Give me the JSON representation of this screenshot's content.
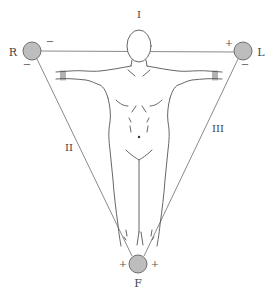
{
  "colors": {
    "line": "#8a8a8a",
    "figure_line": "#555555",
    "electrode_fill": "#bdbdbd",
    "electrode_stroke": "#6e6e6e",
    "text": "#444444"
  },
  "electrodes": [
    {
      "id": "R",
      "label": "R",
      "meaning": "right arm",
      "cx": 32,
      "cy": 51
    },
    {
      "id": "L",
      "label": "L",
      "meaning": "left arm",
      "cx": 243,
      "cy": 51
    },
    {
      "id": "F",
      "label": "F",
      "meaning": "foot (left leg)",
      "cx": 138,
      "cy": 264
    }
  ],
  "leads": [
    {
      "id": "I",
      "label": "I",
      "from": "R",
      "to": "L"
    },
    {
      "id": "II",
      "label": "II",
      "from": "R",
      "to": "F"
    },
    {
      "id": "III",
      "label": "III",
      "from": "L",
      "to": "F"
    }
  ],
  "polarity_signs": {
    "R_lead_I": "−",
    "R_lead_II": "−",
    "L_lead_I": "+",
    "L_lead_III": "−",
    "F_lead_II": "+",
    "F_lead_III": "+"
  }
}
